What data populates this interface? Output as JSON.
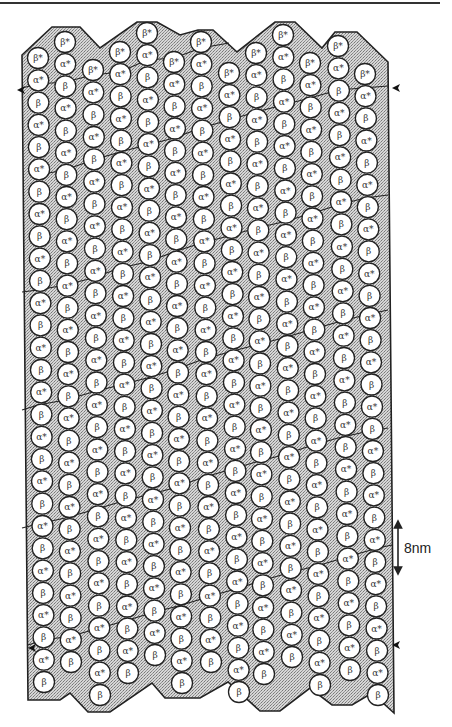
{
  "figure": {
    "scale_bar": {
      "label": "8nm",
      "length_px": 50
    },
    "colors": {
      "outline": "#222222",
      "fill_stipple": "#bdbdbd",
      "subunit_fill": "#ffffff",
      "text": "#333333"
    },
    "subunit_labels": {
      "alpha": "α*",
      "beta": "β",
      "beta_top": "β*"
    },
    "protofilament_count": 13,
    "subunit_spacing_px": 22.5,
    "subunit_radius_px": 10.5,
    "protofilaments": [
      {
        "index": 1,
        "x_top": 38,
        "y_top": 58,
        "x_bottom": 44,
        "y_bottom": 682
      },
      {
        "index": 2,
        "x_top": 65,
        "y_top": 42,
        "x_bottom": 71,
        "y_bottom": 662
      },
      {
        "index": 3,
        "x_top": 93,
        "y_top": 70,
        "x_bottom": 100,
        "y_bottom": 695
      },
      {
        "index": 4,
        "x_top": 120,
        "y_top": 52,
        "x_bottom": 128,
        "y_bottom": 673
      },
      {
        "index": 5,
        "x_top": 147,
        "y_top": 33,
        "x_bottom": 155,
        "y_bottom": 655
      },
      {
        "index": 6,
        "x_top": 174,
        "y_top": 62,
        "x_bottom": 182,
        "y_bottom": 683
      },
      {
        "index": 7,
        "x_top": 201,
        "y_top": 42,
        "x_bottom": 211,
        "y_bottom": 662
      },
      {
        "index": 8,
        "x_top": 229,
        "y_top": 73,
        "x_bottom": 239,
        "y_bottom": 692
      },
      {
        "index": 9,
        "x_top": 256,
        "y_top": 53,
        "x_bottom": 264,
        "y_bottom": 674
      },
      {
        "index": 10,
        "x_top": 283,
        "y_top": 35,
        "x_bottom": 292,
        "y_bottom": 657
      },
      {
        "index": 11,
        "x_top": 310,
        "y_top": 63,
        "x_bottom": 320,
        "y_bottom": 685
      },
      {
        "index": 12,
        "x_top": 338,
        "y_top": 46,
        "x_bottom": 350,
        "y_bottom": 670
      },
      {
        "index": 13,
        "x_top": 365,
        "y_top": 74,
        "x_bottom": 378,
        "y_bottom": 695
      }
    ],
    "outline_top": [
      [
        22,
        55
      ],
      [
        52,
        27
      ],
      [
        80,
        27
      ],
      [
        100,
        48
      ],
      [
        137,
        22
      ],
      [
        157,
        22
      ],
      [
        180,
        35
      ],
      [
        198,
        30
      ],
      [
        213,
        30
      ],
      [
        237,
        52
      ],
      [
        275,
        22
      ],
      [
        295,
        22
      ],
      [
        322,
        48
      ],
      [
        335,
        32
      ],
      [
        357,
        32
      ],
      [
        388,
        62
      ]
    ],
    "outline_bottom": [
      [
        394,
        713
      ],
      [
        372,
        693
      ],
      [
        352,
        705
      ],
      [
        332,
        705
      ],
      [
        310,
        688
      ],
      [
        280,
        711
      ],
      [
        260,
        711
      ],
      [
        228,
        682
      ],
      [
        200,
        698
      ],
      [
        165,
        698
      ],
      [
        152,
        683
      ],
      [
        110,
        712
      ],
      [
        88,
        712
      ],
      [
        70,
        693
      ],
      [
        60,
        700
      ],
      [
        28,
        700
      ]
    ],
    "seam_arrows": [
      {
        "name": "top-left",
        "x": 17,
        "y": 90,
        "dir": "left"
      },
      {
        "name": "top-right",
        "x": 392,
        "y": 88,
        "dir": "left"
      },
      {
        "name": "bottom-left",
        "x": 28,
        "y": 648,
        "dir": "left"
      },
      {
        "name": "bottom-right",
        "x": 392,
        "y": 645,
        "dir": "left"
      }
    ],
    "helix_lines": [
      [
        [
          22,
          88
        ],
        [
          38,
          84
        ],
        [
          65,
          82
        ],
        [
          93,
          75
        ],
        [
          120,
          72
        ],
        [
          147,
          60
        ],
        [
          174,
          58
        ],
        [
          201,
          48
        ],
        [
          229,
          43
        ]
      ],
      [
        [
          38,
          175
        ],
        [
          65,
          170
        ],
        [
          93,
          160
        ],
        [
          120,
          152
        ],
        [
          147,
          145
        ],
        [
          174,
          138
        ],
        [
          201,
          128
        ],
        [
          229,
          120
        ],
        [
          256,
          112
        ],
        [
          283,
          105
        ],
        [
          310,
          98
        ],
        [
          338,
          90
        ],
        [
          388,
          86
        ]
      ],
      [
        [
          22,
          292
        ],
        [
          38,
          290
        ],
        [
          65,
          285
        ],
        [
          93,
          278
        ],
        [
          120,
          268
        ],
        [
          147,
          262
        ],
        [
          174,
          252
        ],
        [
          201,
          243
        ],
        [
          229,
          236
        ],
        [
          256,
          228
        ],
        [
          283,
          222
        ],
        [
          310,
          214
        ],
        [
          338,
          205
        ],
        [
          365,
          198
        ],
        [
          388,
          195
        ]
      ],
      [
        [
          22,
          410
        ],
        [
          38,
          405
        ],
        [
          65,
          400
        ],
        [
          93,
          392
        ],
        [
          120,
          385
        ],
        [
          147,
          378
        ],
        [
          174,
          370
        ],
        [
          201,
          360
        ],
        [
          229,
          352
        ],
        [
          256,
          345
        ],
        [
          283,
          338
        ],
        [
          310,
          330
        ],
        [
          338,
          322
        ],
        [
          365,
          315
        ],
        [
          388,
          310
        ]
      ],
      [
        [
          22,
          528
        ],
        [
          38,
          524
        ],
        [
          65,
          518
        ],
        [
          93,
          510
        ],
        [
          120,
          502
        ],
        [
          147,
          495
        ],
        [
          174,
          488
        ],
        [
          201,
          478
        ],
        [
          229,
          470
        ],
        [
          256,
          462
        ],
        [
          283,
          455
        ],
        [
          310,
          446
        ],
        [
          338,
          438
        ],
        [
          365,
          432
        ],
        [
          388,
          428
        ]
      ],
      [
        [
          28,
          645
        ],
        [
          44,
          640
        ],
        [
          71,
          636
        ],
        [
          100,
          628
        ],
        [
          128,
          620
        ],
        [
          155,
          612
        ],
        [
          182,
          605
        ],
        [
          211,
          596
        ],
        [
          239,
          588
        ],
        [
          264,
          580
        ],
        [
          292,
          572
        ],
        [
          320,
          565
        ],
        [
          350,
          556
        ],
        [
          378,
          548
        ],
        [
          392,
          545
        ]
      ]
    ]
  }
}
